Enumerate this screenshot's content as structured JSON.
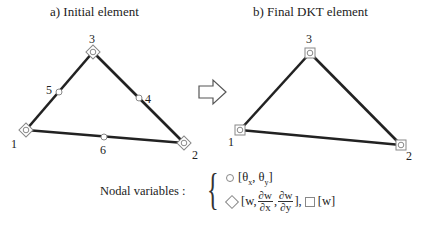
{
  "panel_a": {
    "title": "a) Initial element",
    "nodes": [
      {
        "id": "1",
        "type": "corner",
        "symbol": "diamond-circle"
      },
      {
        "id": "2",
        "type": "corner",
        "symbol": "diamond-circle"
      },
      {
        "id": "3",
        "type": "corner",
        "symbol": "diamond-circle"
      },
      {
        "id": "4",
        "type": "midside",
        "symbol": "circle"
      },
      {
        "id": "5",
        "type": "midside",
        "symbol": "circle"
      },
      {
        "id": "6",
        "type": "midside",
        "symbol": "circle"
      }
    ]
  },
  "transition_arrow": "right-arrow-icon",
  "panel_b": {
    "title": "b) Final DKT element",
    "nodes": [
      {
        "id": "1",
        "type": "corner",
        "symbol": "square-circle"
      },
      {
        "id": "2",
        "type": "corner",
        "symbol": "square-circle"
      },
      {
        "id": "3",
        "type": "corner",
        "symbol": "square-circle"
      }
    ]
  },
  "legend": {
    "label": "Nodal variables :",
    "row1": {
      "symbol": "circle",
      "text_open": "[θ",
      "sub_x": "x",
      "sep": ", θ",
      "sub_y": "y",
      "text_close": "]"
    },
    "row2": {
      "symbol": "diamond",
      "text_open": "[w,",
      "frac1_num": "∂w",
      "frac1_den": "∂x",
      "comma": ",",
      "frac2_num": "∂w",
      "frac2_den": "∂y",
      "text_close": "],",
      "square_symbol": "square",
      "square_text": "[w]"
    }
  }
}
